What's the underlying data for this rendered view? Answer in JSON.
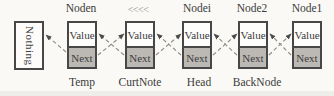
{
  "diagram": {
    "nothing_box_label": "Nothing",
    "nodes": [
      {
        "top_label": "Noden",
        "value_label": "Value",
        "next_label": "Next",
        "bottom_label": "Temp"
      },
      {
        "top_label": "<<<<",
        "value_label": "Value",
        "next_label": "Next",
        "bottom_label": "CurtNote"
      },
      {
        "top_label": "Nodei",
        "value_label": "Value",
        "next_label": "Next",
        "bottom_label": "Head"
      },
      {
        "top_label": "Node2",
        "value_label": "Value",
        "next_label": "Next",
        "bottom_label": "BackNode"
      },
      {
        "top_label": "Node1",
        "value_label": "Value",
        "next_label": "Next",
        "bottom_label": ""
      }
    ],
    "arrows": [
      {
        "from": "Temp.Next",
        "to": "Nothing"
      },
      {
        "from": "CurtNote.Next",
        "to": "Temp.Value"
      },
      {
        "from": "Temp.Next",
        "to": "CurtNote.Value"
      },
      {
        "from": "Head.Next",
        "to": "CurtNote.Value"
      },
      {
        "from": "CurtNote.Next",
        "to": "Head.Value"
      },
      {
        "from": "BackNode.Next",
        "to": "Head.Value"
      },
      {
        "from": "Head.Next",
        "to": "BackNode.Value"
      },
      {
        "from": "Node1.Next",
        "to": "BackNode.Value"
      },
      {
        "from": "BackNode.Next",
        "to": "Node1.Value"
      }
    ],
    "colors": {
      "next_cell_fill": "#bcb9b5",
      "value_cell_fill": "#fdfdfc",
      "box_border": "#474747",
      "arrow_line": "#8e8a84",
      "arrowhead": "#4c4c4c",
      "text": "#3b3b3b",
      "marker_text": "#8f8b86"
    }
  }
}
